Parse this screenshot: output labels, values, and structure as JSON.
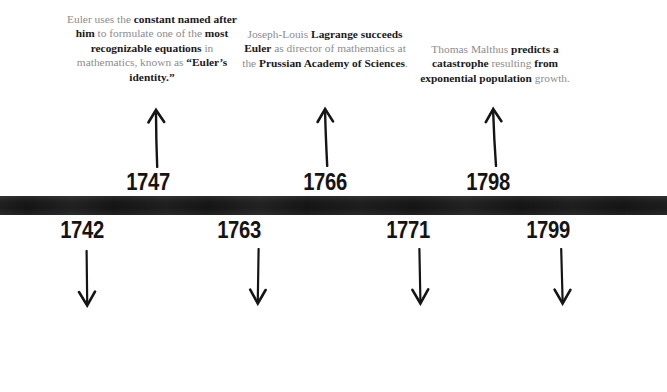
{
  "figure": {
    "type": "timeline",
    "orientation": "horizontal",
    "bar_color": "#1c1c1e",
    "body_text_color": "#8d8d8d",
    "emphasis_text_color": "#1a1a1a",
    "year_text_color": "#141414"
  },
  "timeline": {
    "events_above": [
      {
        "year": "1747",
        "arrow": "arrow-up-icon",
        "text_html": "Euler uses the <b>constant named after him</b> to formulate one of the <b>most recognizable equations</b> in mathematics, known as <b>&ldquo;Euler&rsquo;s identity.&rdquo;</b>",
        "text_plain": "Euler uses the constant named after him to formulate one of the most recognizable equations in mathematics, known as “Euler’s identity.”"
      },
      {
        "year": "1766",
        "arrow": "arrow-up-icon",
        "text_html": "Joseph-Louis <b>Lagrange succeeds Euler</b> as director of mathematics at the <b>Prussian Academy of Sciences</b>.",
        "text_plain": "Joseph-Louis Lagrange succeeds Euler as director of mathematics at the Prussian Academy of Sciences."
      },
      {
        "year": "1798",
        "arrow": "arrow-up-icon",
        "text_html": "Thomas Malthus <b>predicts a catastrophe</b> resulting <b>from exponential population</b> growth.",
        "text_plain": "Thomas Malthus predicts a catastrophe resulting from exponential population growth."
      }
    ],
    "events_below": [
      {
        "year": "1742",
        "arrow": "arrow-down-icon",
        "text_html": "The famous conjecture that every <b>even integer greater than 2</b> is the <b>sum of two primes</b> is proposed by Christian Goldbach.",
        "text_plain": "The famous conjecture that every even integer greater than 2 is the sum of two primes is proposed by Christian Goldbach."
      },
      {
        "year": "1763",
        "arrow": "arrow-down-icon",
        "text_html": "Bayes&rsquo; theorem, which <b>predicts the likelihood of future events based on prior knowledge</b>, is established.",
        "text_plain": "Bayes’ theorem, which predicts the likelihood of future events based on prior knowledge, is established."
      },
      {
        "year": "1771",
        "arrow": "arrow-down-icon",
        "text_html": "An <b>algebraic resolution</b> for the <b>roots of polynomials</b> is formulated by Lagrange.",
        "text_plain": "An algebraic resolution for the roots of polynomials is formulated by Lagrange."
      },
      {
        "year": "1799",
        "arrow": "arrow-down-icon",
        "text_html": "Carl Friedrich Gauss produces his <b>fundamental theorem of algebra</b> aged 21.",
        "text_plain": "Carl Friedrich Gauss produces his fundamental theorem of algebra aged 21."
      }
    ]
  }
}
